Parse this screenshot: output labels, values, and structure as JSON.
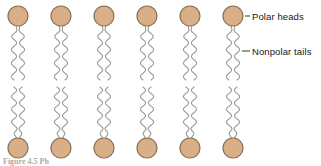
{
  "figure": {
    "caption": "Figure 4.5 Ph",
    "background_color": "#ffffff",
    "width": 321,
    "height": 166
  },
  "labels": {
    "polar_heads": "Polar heads",
    "nonpolar_tails": "Nonpolar tails",
    "leader_color": "#4a4a48"
  },
  "colors": {
    "head_fill": "#d9af87",
    "head_stroke": "#8b6f52",
    "tail_stroke": "#9a9a96",
    "text": "#16181a"
  },
  "geometry": {
    "head_radius": 10,
    "head_stroke_width": 1.2,
    "tail_stroke_width": 1.1,
    "column_centers": [
      18,
      61,
      104,
      147,
      190,
      233
    ],
    "upper_head_cy": 16,
    "upper_tail_start_y": 26,
    "upper_tail_end_y": 80,
    "lower_tail_start_y": 87,
    "lower_tail_end_y": 138,
    "lower_head_cy": 148,
    "tail_half_spread": 4.0,
    "wave_amplitude": 2.6,
    "wave_count": 4
  },
  "chart_data": {
    "type": "diagram",
    "structure": "lipid-bilayer",
    "leaflets": [
      {
        "name": "upper leaflet",
        "head_position": "top",
        "molecule_count": 6,
        "head_y": 16,
        "tail_span_y": [
          26,
          80
        ]
      },
      {
        "name": "lower leaflet",
        "head_position": "bottom",
        "molecule_count": 6,
        "head_y": 148,
        "tail_span_y": [
          87,
          138
        ]
      }
    ],
    "molecule_parts": [
      {
        "name": "Polar heads",
        "shape": "circle",
        "color": "#d9af87",
        "count": 12
      },
      {
        "name": "Nonpolar tails",
        "shape": "wavy-line",
        "color": "#9a9a96",
        "per_molecule": 2,
        "count": 24
      }
    ],
    "annotations": [
      {
        "text": "Polar heads",
        "points_to": "upper-right head circle"
      },
      {
        "text": "Nonpolar tails",
        "points_to": "upper-right tail pair"
      }
    ]
  }
}
